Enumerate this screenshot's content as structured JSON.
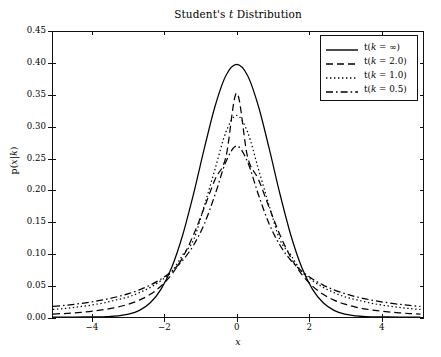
{
  "chart_data": {
    "type": "line",
    "title": "Student's t Distribution",
    "xlabel": "x",
    "ylabel": "p(x|k)",
    "xlim": [
      -5.1,
      5.17
    ],
    "ylim": [
      0.0,
      0.45
    ],
    "xticks": [
      -4,
      -2,
      0,
      2,
      4
    ],
    "xtick_labels": [
      "−4",
      "−2",
      "0",
      "2",
      "4"
    ],
    "yticks": [
      0.0,
      0.05,
      0.1,
      0.15,
      0.2,
      0.25,
      0.3,
      0.35,
      0.4,
      0.45
    ],
    "ytick_labels": [
      "0.00",
      "0.05",
      "0.10",
      "0.15",
      "0.20",
      "0.25",
      "0.30",
      "0.35",
      "0.40",
      "0.45"
    ],
    "grid": false,
    "legend_position": "upper right",
    "color": "#000000",
    "series": [
      {
        "name": "t(k = ∞)",
        "k": "inf",
        "linestyle": "solid",
        "peak_value": 0.3989,
        "x": [
          -5.1,
          -4.8,
          -4.5,
          -4.2,
          -3.9,
          -3.6,
          -3.3,
          -3.0,
          -2.7,
          -2.4,
          -2.1,
          -1.8,
          -1.5,
          -1.2,
          -0.9,
          -0.6,
          -0.3,
          0.0,
          0.3,
          0.6,
          0.9,
          1.2,
          1.5,
          1.8,
          2.1,
          2.4,
          2.7,
          3.0,
          3.3,
          3.6,
          3.9,
          4.2,
          4.5,
          4.8,
          5.1
        ],
        "y": [
          0.0,
          0.0,
          0.0,
          0.0001,
          0.0002,
          0.0006,
          0.0017,
          0.0044,
          0.0104,
          0.0224,
          0.044,
          0.079,
          0.1295,
          0.1942,
          0.2661,
          0.3332,
          0.3814,
          0.3989,
          0.3814,
          0.3332,
          0.2661,
          0.1942,
          0.1295,
          0.079,
          0.044,
          0.0224,
          0.0104,
          0.0044,
          0.0017,
          0.0006,
          0.0002,
          0.0001,
          0.0,
          0.0,
          0.0
        ]
      },
      {
        "name": "t(k = 2.0)",
        "k": 2.0,
        "linestyle": "dashed",
        "peak_value": 0.3536,
        "x": [
          -5.1,
          -4.8,
          -4.5,
          -4.2,
          -3.9,
          -3.6,
          -3.3,
          -3.0,
          -2.7,
          -2.4,
          -2.1,
          -1.8,
          -1.5,
          -1.2,
          -0.9,
          -0.6,
          -0.3,
          0.0,
          0.3,
          0.6,
          0.9,
          1.2,
          1.5,
          1.8,
          2.1,
          2.4,
          2.7,
          3.0,
          3.3,
          3.6,
          3.9,
          4.2,
          4.5,
          4.8,
          5.1
        ],
        "y": [
          0.0046,
          0.0055,
          0.0066,
          0.008,
          0.0099,
          0.0124,
          0.0157,
          0.0203,
          0.0267,
          0.0358,
          0.0489,
          0.0677,
          0.0941,
          0.1296,
          0.1729,
          0.2175,
          0.2529,
          0.3536,
          0.2529,
          0.2175,
          0.1729,
          0.1296,
          0.0941,
          0.0677,
          0.0489,
          0.0358,
          0.0267,
          0.0203,
          0.0157,
          0.0124,
          0.0099,
          0.008,
          0.0066,
          0.0055,
          0.0046
        ]
      },
      {
        "name": "t(k = 1.0)",
        "k": 1.0,
        "linestyle": "dotted",
        "peak_value": 0.3183,
        "x": [
          -5.1,
          -4.8,
          -4.5,
          -4.2,
          -3.9,
          -3.6,
          -3.3,
          -3.0,
          -2.7,
          -2.4,
          -2.1,
          -1.8,
          -1.5,
          -1.2,
          -0.9,
          -0.6,
          -0.3,
          0.0,
          0.3,
          0.6,
          0.9,
          1.2,
          1.5,
          1.8,
          2.1,
          2.4,
          2.7,
          3.0,
          3.3,
          3.6,
          3.9,
          4.2,
          4.5,
          4.8,
          5.1
        ],
        "y": [
          0.0119,
          0.0134,
          0.0152,
          0.0174,
          0.0201,
          0.0234,
          0.0276,
          0.0318,
          0.0385,
          0.0468,
          0.0576,
          0.0718,
          0.0979,
          0.1217,
          0.1759,
          0.2339,
          0.2921,
          0.3183,
          0.2921,
          0.2339,
          0.1759,
          0.1217,
          0.0979,
          0.0718,
          0.0576,
          0.0468,
          0.0385,
          0.0318,
          0.0276,
          0.0234,
          0.0201,
          0.0174,
          0.0152,
          0.0134,
          0.0119
        ]
      },
      {
        "name": "t(k = 0.5)",
        "k": 0.5,
        "linestyle": "dashdot",
        "peak_value": 0.27,
        "x": [
          -5.1,
          -4.8,
          -4.5,
          -4.2,
          -3.9,
          -3.6,
          -3.3,
          -3.0,
          -2.7,
          -2.4,
          -2.1,
          -1.8,
          -1.5,
          -1.2,
          -0.9,
          -0.6,
          -0.3,
          0.0,
          0.3,
          0.6,
          0.9,
          1.2,
          1.5,
          1.8,
          2.1,
          2.4,
          2.7,
          3.0,
          3.3,
          3.6,
          3.9,
          4.2,
          4.5,
          4.8,
          5.1
        ],
        "y": [
          0.0166,
          0.0182,
          0.0201,
          0.0224,
          0.0251,
          0.0283,
          0.0322,
          0.037,
          0.0429,
          0.0504,
          0.06,
          0.0726,
          0.0896,
          0.1133,
          0.147,
          0.1935,
          0.245,
          0.27,
          0.245,
          0.1935,
          0.147,
          0.1133,
          0.0896,
          0.0726,
          0.06,
          0.0504,
          0.0429,
          0.037,
          0.0322,
          0.0283,
          0.0251,
          0.0224,
          0.0201,
          0.0182,
          0.0166
        ]
      }
    ]
  }
}
